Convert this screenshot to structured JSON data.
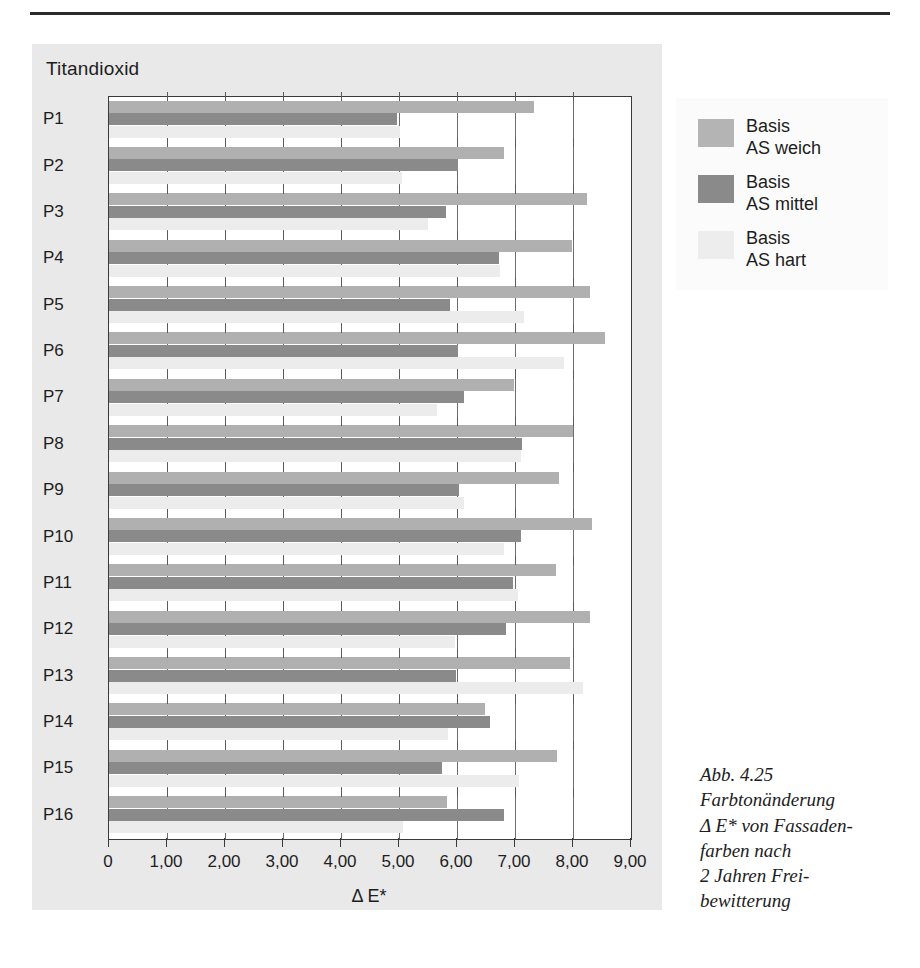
{
  "panel": {
    "title": "Titandioxid"
  },
  "legend": {
    "position": "right-top",
    "items": [
      {
        "key": "weich",
        "line1": "Basis",
        "line2": "AS weich",
        "color": "#b4b4b4"
      },
      {
        "key": "mittel",
        "line1": "Basis",
        "line2": "AS mittel",
        "color": "#8a8a8a"
      },
      {
        "key": "hart",
        "line1": "Basis",
        "line2": "AS hart",
        "color": "#ededed"
      }
    ]
  },
  "caption": {
    "lines": [
      "Abb. 4.25",
      "Farbtonänderung",
      "Δ E* von Fassaden-",
      "farben nach",
      "2 Jahren Frei-",
      "bewitterung"
    ]
  },
  "chart_data": {
    "type": "bar",
    "orientation": "horizontal",
    "title": "Titandioxid",
    "xlabel": "Δ E*",
    "ylabel": "",
    "xlim": [
      0,
      9
    ],
    "xticks": [
      0,
      1,
      2,
      3,
      4,
      5,
      6,
      7,
      8,
      9
    ],
    "xtick_labels": [
      "0",
      "1,00",
      "2,00",
      "3,00",
      "4,00",
      "5,00",
      "6,00",
      "7,00",
      "8,00",
      "9,00"
    ],
    "grid": true,
    "legend_position": "outside-right",
    "categories": [
      "P1",
      "P2",
      "P3",
      "P4",
      "P5",
      "P6",
      "P7",
      "P8",
      "P9",
      "P10",
      "P11",
      "P12",
      "P13",
      "P14",
      "P15",
      "P16"
    ],
    "series": [
      {
        "name": "Basis AS weich",
        "color": "#b0b0b0",
        "values": [
          7.33,
          6.81,
          8.24,
          7.98,
          8.3,
          8.55,
          6.98,
          8.0,
          7.76,
          8.33,
          7.71,
          8.29,
          7.95,
          6.48,
          7.72,
          5.83
        ]
      },
      {
        "name": "Basis AS mittel",
        "color": "#8a8a8a",
        "values": [
          4.96,
          6.02,
          5.81,
          6.72,
          5.88,
          6.02,
          6.12,
          7.12,
          6.03,
          7.1,
          6.96,
          6.84,
          5.98,
          6.57,
          5.74,
          6.81
        ]
      },
      {
        "name": "Basis AS hart",
        "color": "#ececec",
        "values": [
          5.02,
          5.05,
          5.5,
          6.74,
          7.16,
          7.84,
          5.65,
          7.1,
          6.12,
          6.81,
          7.05,
          5.97,
          8.17,
          5.84,
          7.07,
          5.07
        ]
      }
    ]
  }
}
